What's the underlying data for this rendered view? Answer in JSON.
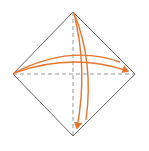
{
  "diagram": {
    "type": "origami-fold-instruction",
    "shape": "square-on-point",
    "colors": {
      "outline": "#555555",
      "crease": "#8a8a8a",
      "arrow": "#e8742c",
      "background": "#ffffff"
    },
    "vertices": {
      "top": [
        73,
        12
      ],
      "left": [
        13,
        74
      ],
      "right": [
        135,
        74
      ],
      "bottom": [
        73,
        136
      ]
    },
    "creases": [
      {
        "name": "horizontal-diagonal",
        "style": "dashed"
      },
      {
        "name": "vertical-diagonal",
        "style": "dashed"
      }
    ],
    "arrows": [
      {
        "name": "fold-left-to-right",
        "direction": "right",
        "count": 2
      },
      {
        "name": "fold-top-to-bottom",
        "direction": "down",
        "count": 2
      }
    ]
  }
}
